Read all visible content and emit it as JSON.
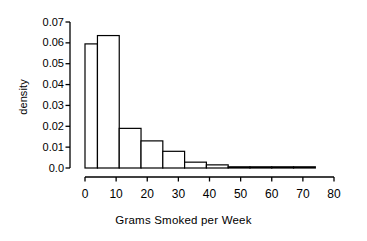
{
  "chart_data": {
    "type": "bar",
    "title": "",
    "subtitle": "",
    "xlabel": "Grams Smoked per Week",
    "ylabel": "density",
    "xlim": [
      -2,
      82
    ],
    "ylim": [
      0.0,
      0.07
    ],
    "grid": false,
    "legend": null,
    "x_ticks": [
      {
        "value": 0,
        "label": "0"
      },
      {
        "value": 10,
        "label": "10"
      },
      {
        "value": 20,
        "label": "20"
      },
      {
        "value": 30,
        "label": "30"
      },
      {
        "value": 40,
        "label": "40"
      },
      {
        "value": 50,
        "label": "50"
      },
      {
        "value": 60,
        "label": "60"
      },
      {
        "value": 70,
        "label": "70"
      },
      {
        "value": 80,
        "label": "80"
      }
    ],
    "y_ticks": [
      {
        "value": 0.0,
        "label": "0.0"
      },
      {
        "value": 0.01,
        "label": "0.01"
      },
      {
        "value": 0.02,
        "label": "0.02"
      },
      {
        "value": 0.03,
        "label": "0.03"
      },
      {
        "value": 0.04,
        "label": "0.04"
      },
      {
        "value": 0.05,
        "label": "0.05"
      },
      {
        "value": 0.06,
        "label": "0.06"
      },
      {
        "value": 0.07,
        "label": "0.07"
      }
    ],
    "bin_edges": [
      0,
      4,
      11,
      18,
      25,
      32,
      39,
      46,
      53,
      60,
      67,
      74
    ],
    "values": [
      0.0595,
      0.0635,
      0.019,
      0.013,
      0.008,
      0.0028,
      0.0015,
      0.0,
      0.0004,
      0.0,
      0.0004
    ],
    "bars": [
      {
        "x0": 0,
        "x1": 4,
        "density": 0.0595
      },
      {
        "x0": 4,
        "x1": 11,
        "density": 0.0635
      },
      {
        "x0": 11,
        "x1": 18,
        "density": 0.019
      },
      {
        "x0": 18,
        "x1": 25,
        "density": 0.013
      },
      {
        "x0": 25,
        "x1": 32,
        "density": 0.008
      },
      {
        "x0": 32,
        "x1": 39,
        "density": 0.0028
      },
      {
        "x0": 39,
        "x1": 46,
        "density": 0.0015
      },
      {
        "x0": 46,
        "x1": 53,
        "density": 0.0
      },
      {
        "x0": 53,
        "x1": 60,
        "density": 0.0004
      },
      {
        "x0": 60,
        "x1": 67,
        "density": 0.0
      },
      {
        "x0": 67,
        "x1": 74,
        "density": 0.0004
      }
    ],
    "bar_fill": "#ffffff",
    "bar_stroke": "#000000",
    "axis_color": "#000000"
  }
}
